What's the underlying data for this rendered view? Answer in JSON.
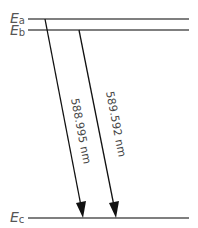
{
  "diagram": {
    "levels": [
      {
        "id": "a",
        "symbol": "E",
        "subscript": "a"
      },
      {
        "id": "b",
        "symbol": "E",
        "subscript": "b"
      },
      {
        "id": "c",
        "symbol": "E",
        "subscript": "c"
      }
    ],
    "transitions": [
      {
        "from": "a",
        "to": "c",
        "label": "588.995 nm"
      },
      {
        "from": "b",
        "to": "c",
        "label": "589.592 nm"
      }
    ],
    "colors": {
      "level_line": "#555555",
      "arrow": "#111111"
    }
  }
}
